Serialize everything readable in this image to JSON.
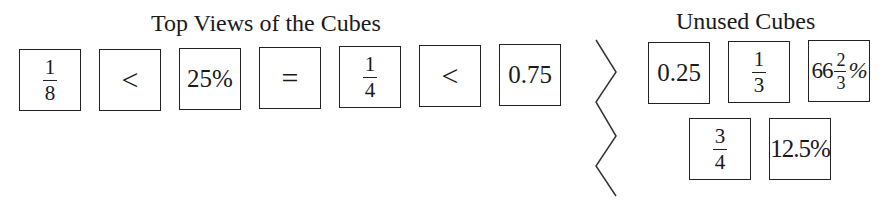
{
  "top_views": {
    "title": "Top Views of the Cubes",
    "cubes": [
      {
        "type": "fraction",
        "num": "1",
        "den": "8"
      },
      {
        "type": "symbol",
        "text": "<"
      },
      {
        "type": "text",
        "text": "25%"
      },
      {
        "type": "symbol",
        "text": "="
      },
      {
        "type": "fraction",
        "num": "1",
        "den": "4"
      },
      {
        "type": "symbol",
        "text": "<"
      },
      {
        "type": "text",
        "text": "0.75"
      }
    ]
  },
  "unused": {
    "title": "Unused Cubes",
    "cubes": [
      {
        "type": "text",
        "text": "0.25"
      },
      {
        "type": "fraction",
        "num": "1",
        "den": "3"
      },
      {
        "type": "mixed",
        "whole": "66",
        "num": "2",
        "den": "3",
        "suffix": "%"
      },
      {
        "type": "fraction",
        "num": "3",
        "den": "4"
      },
      {
        "type": "text",
        "text": "12.5%"
      }
    ]
  },
  "separator": {
    "icon": "zigzag-divider"
  }
}
